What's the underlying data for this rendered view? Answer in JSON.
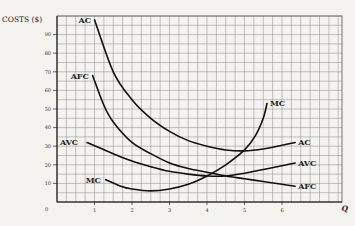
{
  "chart_data": {
    "type": "line",
    "title": "",
    "xlabel": "Q",
    "ylabel": "COSTS ($)",
    "xlim": [
      0,
      7.5
    ],
    "ylim": [
      0,
      98
    ],
    "grid": true,
    "x_ticks": [
      "1",
      "2",
      "3",
      "4",
      "5",
      "6"
    ],
    "y_ticks": [
      "10",
      "20",
      "30",
      "40",
      "50",
      "60",
      "70",
      "80",
      "90"
    ],
    "origin_label": "0",
    "series": [
      {
        "name": "AC",
        "label_pos": "start-and-end",
        "points": [
          [
            1.0,
            98
          ],
          [
            1.5,
            70
          ],
          [
            2,
            55
          ],
          [
            2.5,
            45
          ],
          [
            3,
            38
          ],
          [
            3.5,
            33
          ],
          [
            4,
            30
          ],
          [
            4.5,
            28
          ],
          [
            5,
            27.5
          ],
          [
            5.5,
            28.5
          ],
          [
            6,
            30.5
          ],
          [
            6.35,
            32
          ]
        ]
      },
      {
        "name": "AFC",
        "label_pos": "start-and-end",
        "points": [
          [
            0.95,
            68
          ],
          [
            1.25,
            52
          ],
          [
            1.5,
            43
          ],
          [
            2,
            32
          ],
          [
            2.5,
            26
          ],
          [
            3,
            21
          ],
          [
            3.5,
            18
          ],
          [
            4,
            16
          ],
          [
            4.5,
            14
          ],
          [
            5,
            12.5
          ],
          [
            5.5,
            11
          ],
          [
            6,
            9.5
          ],
          [
            6.35,
            8.5
          ]
        ]
      },
      {
        "name": "AVC",
        "label_pos": "start-and-end",
        "points": [
          [
            0.8,
            32
          ],
          [
            1.5,
            26
          ],
          [
            2,
            22
          ],
          [
            2.5,
            19
          ],
          [
            3,
            16.5
          ],
          [
            3.5,
            15
          ],
          [
            4,
            14
          ],
          [
            4.5,
            14
          ],
          [
            5,
            15.5
          ],
          [
            5.5,
            17.5
          ],
          [
            6,
            19.5
          ],
          [
            6.35,
            21
          ]
        ]
      },
      {
        "name": "MC",
        "label_pos": "start-and-end",
        "points": [
          [
            1.3,
            12
          ],
          [
            1.7,
            8.5
          ],
          [
            2,
            7
          ],
          [
            2.5,
            6
          ],
          [
            3,
            7
          ],
          [
            3.5,
            9.5
          ],
          [
            4,
            14
          ],
          [
            4.5,
            20
          ],
          [
            5,
            28
          ],
          [
            5.3,
            36
          ],
          [
            5.5,
            45
          ],
          [
            5.6,
            53
          ]
        ]
      }
    ]
  }
}
